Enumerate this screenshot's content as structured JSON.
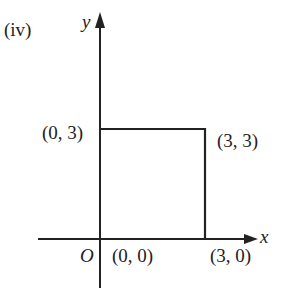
{
  "figure": {
    "part_label": "(iv)",
    "axes": {
      "x_label": "x",
      "y_label": "y",
      "origin_label": "O"
    },
    "points": [
      {
        "label": "(0, 0)",
        "x": 0,
        "y": 0
      },
      {
        "label": "(3, 0)",
        "x": 3,
        "y": 0
      },
      {
        "label": "(3, 3)",
        "x": 3,
        "y": 3
      },
      {
        "label": "(0, 3)",
        "x": 0,
        "y": 3
      }
    ],
    "shape": "square",
    "colors": {
      "line": "#222222",
      "background": "#ffffff"
    }
  }
}
